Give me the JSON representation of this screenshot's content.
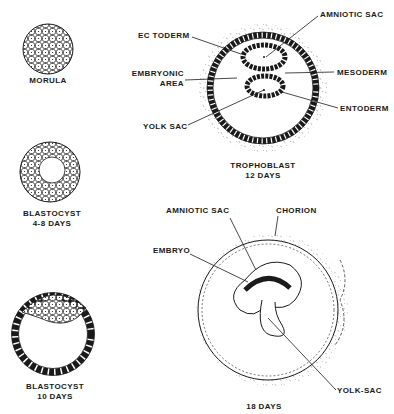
{
  "panels": {
    "morula": {
      "caption": "MORULA"
    },
    "blastocyst_early": {
      "caption_line1": "BLASTOCYST",
      "caption_line2": "4-8 DAYS"
    },
    "blastocyst_late": {
      "caption_line1": "BLASTOCYST",
      "caption_line2": "10 DAYS"
    },
    "day12": {
      "caption_line1": "TROPHOBLAST",
      "caption_line2": "12 DAYS",
      "labels": {
        "amniotic_sac": "AMNIOTIC SAC",
        "ectoderm": "EC TODERM",
        "embryonic_area_1": "EMBRYONIC",
        "embryonic_area_2": "AREA",
        "mesoderm": "MESODERM",
        "entoderm": "ENTODERM",
        "yolk_sac": "YOLK SAC"
      }
    },
    "day18": {
      "caption": "18 DAYS",
      "labels": {
        "amniotic_sac": "AMNIOTIC SAC",
        "chorion": "CHORION",
        "embryo": "EMBRYO",
        "yolk_sac": "YOLK-SAC"
      }
    }
  }
}
